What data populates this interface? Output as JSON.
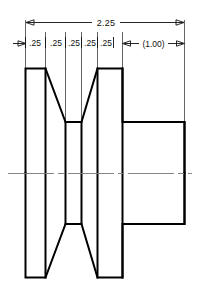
{
  "drawing": {
    "title": "V-belt pulley sectional view",
    "view_type": "section",
    "units": "inches",
    "colors": {
      "object_line": "#000000",
      "extension_line": "#555555",
      "dimension_line": "#111111",
      "center_line": "#777777",
      "background": "#ffffff",
      "text": "#111111"
    },
    "dimensions": {
      "overall": {
        "label": "2.25",
        "kind": "overall-width"
      },
      "segments": [
        {
          "label": ".25"
        },
        {
          "label": ".25"
        },
        {
          "label": ".25"
        },
        {
          "label": ".25"
        },
        {
          "label": ".25"
        }
      ],
      "reference": {
        "label": "(1.00)",
        "kind": "reference-hub-length"
      }
    },
    "geometry": {
      "left_flange": {
        "x_start": 25,
        "x_end": 45,
        "y_top": 68,
        "y_bottom": 278
      },
      "groove": {
        "taper_top_y": 68,
        "root_y": 122,
        "root_x_start": 65,
        "root_x_end": 97
      },
      "right_flange": {
        "x_start": 97,
        "x_end": 122,
        "y_top": 68,
        "y_bottom": 278
      },
      "hub": {
        "x_start": 122,
        "x_end": 185,
        "y_top": 122,
        "y_bottom": 215
      },
      "centerline_y": 173
    }
  }
}
